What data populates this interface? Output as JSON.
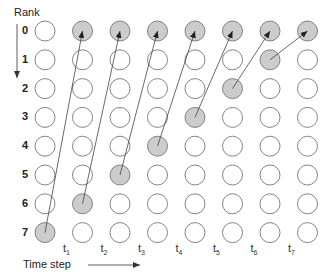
{
  "axis": {
    "rank_label": "Rank",
    "time_label": "Time step",
    "ranks": [
      "0",
      "1",
      "2",
      "3",
      "4",
      "5",
      "6",
      "7"
    ],
    "time_steps": [
      {
        "base": "t",
        "sub": "1"
      },
      {
        "base": "t",
        "sub": "2"
      },
      {
        "base": "t",
        "sub": "3"
      },
      {
        "base": "t",
        "sub": "4"
      },
      {
        "base": "t",
        "sub": "5"
      },
      {
        "base": "t",
        "sub": "6"
      },
      {
        "base": "t",
        "sub": "7"
      }
    ]
  },
  "grid": {
    "rows": 8,
    "cols": 8
  },
  "shaded_nodes": [
    [
      0,
      7
    ],
    [
      1,
      6
    ],
    [
      2,
      5
    ],
    [
      3,
      4
    ],
    [
      4,
      3
    ],
    [
      5,
      2
    ],
    [
      6,
      1
    ],
    [
      1,
      0
    ],
    [
      2,
      0
    ],
    [
      3,
      0
    ],
    [
      4,
      0
    ],
    [
      5,
      0
    ],
    [
      6,
      0
    ],
    [
      7,
      0
    ]
  ],
  "arrows": [
    {
      "from": [
        0,
        7
      ],
      "to": [
        1,
        0
      ]
    },
    {
      "from": [
        1,
        6
      ],
      "to": [
        2,
        0
      ]
    },
    {
      "from": [
        2,
        5
      ],
      "to": [
        3,
        0
      ]
    },
    {
      "from": [
        3,
        4
      ],
      "to": [
        4,
        0
      ]
    },
    {
      "from": [
        4,
        3
      ],
      "to": [
        5,
        0
      ]
    },
    {
      "from": [
        5,
        2
      ],
      "to": [
        6,
        0
      ]
    },
    {
      "from": [
        6,
        1
      ],
      "to": [
        7,
        0
      ]
    }
  ],
  "colors": {
    "shaded": "#cccccc",
    "stroke": "#777777",
    "arrow": "#222222"
  }
}
